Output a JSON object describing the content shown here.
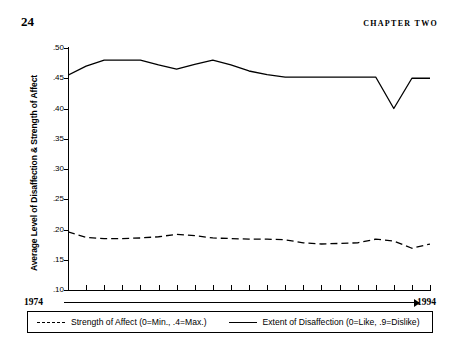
{
  "page": {
    "number": "24",
    "chapter_label": "CHAPTER TWO"
  },
  "chart_data": {
    "type": "line",
    "title": "",
    "xlabel": "",
    "ylabel": "Average Level of Disaffection & Strength of Affect",
    "ylim": [
      0.1,
      0.5
    ],
    "xlim": [
      1974,
      1994
    ],
    "grid": false,
    "legend_position": "bottom",
    "ytick_labels": [
      ".50",
      ".45",
      ".40",
      ".35",
      ".30",
      ".25",
      ".20",
      ".15",
      ".10"
    ],
    "ytick_values": [
      0.5,
      0.45,
      0.4,
      0.35,
      0.3,
      0.25,
      0.2,
      0.15,
      0.1
    ],
    "xtick_count": 21,
    "x_start_label": "1974",
    "x_end_label": "1994",
    "x": [
      1974,
      1975,
      1976,
      1977,
      1978,
      1979,
      1980,
      1981,
      1982,
      1983,
      1984,
      1985,
      1986,
      1987,
      1988,
      1989,
      1990,
      1991,
      1992,
      1993,
      1994
    ],
    "series": [
      {
        "name": "Extent of Disaffection (0=Like, .9=Dislike)",
        "style": "solid",
        "color": "#000000",
        "values": [
          0.455,
          0.47,
          0.48,
          0.48,
          0.48,
          0.472,
          0.465,
          0.473,
          0.48,
          0.472,
          0.462,
          0.456,
          0.452,
          0.452,
          0.452,
          0.452,
          0.452,
          0.452,
          0.4,
          0.45,
          0.45
        ]
      },
      {
        "name": "Strength of Affect (0=Min., .4=Max.)",
        "style": "dashed",
        "color": "#000000",
        "values": [
          0.196,
          0.187,
          0.185,
          0.185,
          0.186,
          0.188,
          0.192,
          0.19,
          0.186,
          0.185,
          0.184,
          0.184,
          0.183,
          0.178,
          0.176,
          0.177,
          0.178,
          0.184,
          0.181,
          0.169,
          0.176
        ]
      }
    ]
  },
  "legend": {
    "entries": [
      {
        "label": "Strength of Affect (0=Min., .4=Max.)",
        "style": "dashed"
      },
      {
        "label": "Extent of Disaffection (0=Like, .9=Dislike)",
        "style": "solid"
      }
    ]
  }
}
